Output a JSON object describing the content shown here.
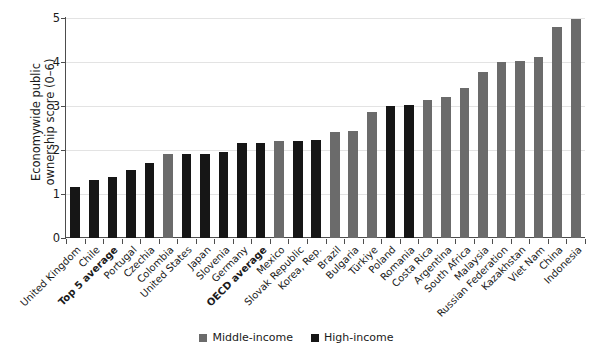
{
  "chart_data": {
    "type": "bar",
    "title": "",
    "subtitle": "",
    "xlabel": "",
    "ylabel": "Economywide public\nownership score (0–6)",
    "ylim": [
      0,
      5
    ],
    "yticks": [
      0,
      1,
      2,
      3,
      4,
      5
    ],
    "ytick_labels": [
      "0",
      "1",
      "2",
      "3",
      "4",
      "5"
    ],
    "grid": true,
    "legend_position": "bottom",
    "legend": [
      {
        "name": "Middle-income",
        "color": "#6b6b6b"
      },
      {
        "name": "High-income",
        "color": "#161616"
      }
    ],
    "categories": [
      "United Kingdom",
      "Chile",
      "Top 5 average",
      "Portugal",
      "Czechia",
      "Colombia",
      "United States",
      "Japan",
      "Slovenia",
      "Germany",
      "OECD average",
      "Mexico",
      "Slovak Republic",
      "Korea, Rep.",
      "Brazil",
      "Bulgaria",
      "Türkiye",
      "Poland",
      "Romania",
      "Costa Rica",
      "Argentina",
      "South Africa",
      "Malaysia",
      "Russian Federation",
      "Kazakhstan",
      "Viet Nam",
      "China",
      "Indonesia"
    ],
    "values": [
      1.17,
      1.32,
      1.38,
      1.54,
      1.7,
      1.9,
      1.91,
      1.92,
      1.95,
      2.15,
      2.17,
      2.2,
      2.2,
      2.23,
      2.4,
      2.43,
      2.86,
      3.0,
      3.02,
      3.13,
      3.21,
      3.41,
      3.77,
      4.0,
      4.02,
      4.11,
      4.8,
      4.97
    ],
    "groups": [
      "High-income",
      "High-income",
      "High-income",
      "High-income",
      "High-income",
      "Middle-income",
      "High-income",
      "High-income",
      "High-income",
      "High-income",
      "High-income",
      "Middle-income",
      "High-income",
      "High-income",
      "Middle-income",
      "Middle-income",
      "Middle-income",
      "High-income",
      "High-income",
      "Middle-income",
      "Middle-income",
      "Middle-income",
      "Middle-income",
      "Middle-income",
      "Middle-income",
      "Middle-income",
      "Middle-income",
      "Middle-income"
    ],
    "bold_categories": [
      "Top 5 average",
      "OECD average"
    ],
    "colors": {
      "middle_income": "#6b6b6b",
      "high_income": "#161616",
      "grid": "#e3e3e3",
      "axis": "#4d4d4d",
      "text": "#1a1a1a",
      "background": "#ffffff"
    }
  }
}
